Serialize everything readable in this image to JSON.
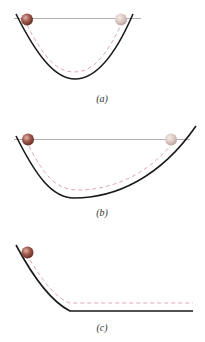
{
  "panels": [
    {
      "id": "a",
      "label": "(a)",
      "track": "symmetric-u-curve",
      "reference_line": true,
      "balls": [
        "start-ball",
        "end-ball-faded"
      ]
    },
    {
      "id": "b",
      "label": "(b)",
      "track": "asymmetric-curve-shallow-right",
      "reference_line": true,
      "balls": [
        "start-ball",
        "end-ball-faded"
      ]
    },
    {
      "id": "c",
      "label": "(c)",
      "track": "slope-to-flat",
      "reference_line": false,
      "balls": [
        "start-ball"
      ]
    }
  ],
  "colors": {
    "track": "#1a1a1a",
    "reference_line": "#9a9a9a",
    "path_dashed": "#e0a8b0",
    "ball": "#8c4a42",
    "ball_faded": "#d9c6c2"
  }
}
